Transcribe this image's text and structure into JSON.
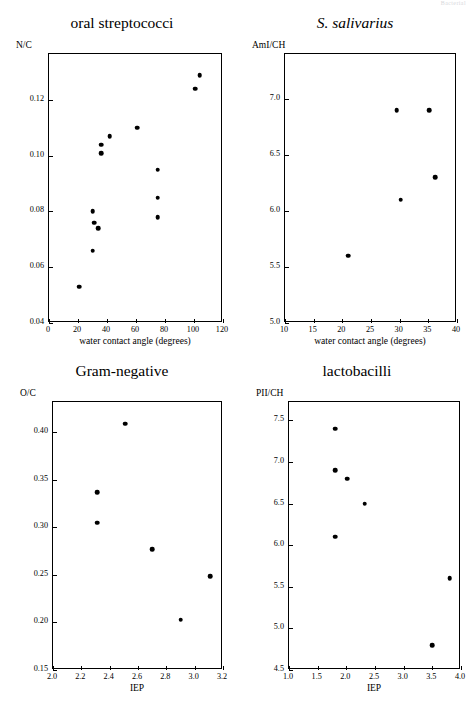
{
  "page": {
    "header_text": "Bacterial"
  },
  "chart_data": [
    {
      "id": "oral-streptococci",
      "type": "scatter",
      "title": "oral streptococci",
      "title_italic": false,
      "ylabel": "N/C",
      "xlabel": "water contact angle (degrees)",
      "xlim": [
        0,
        120
      ],
      "ylim": [
        0.04,
        0.1365
      ],
      "xticks": [
        0,
        20,
        40,
        60,
        80,
        100,
        120
      ],
      "xticklabels": [
        "0",
        "20",
        "40",
        "60",
        "80",
        "100",
        "120"
      ],
      "yticks": [
        0.04,
        0.06,
        0.08,
        0.1,
        0.12
      ],
      "yticklabels": [
        "0.04",
        "0.06",
        "0.08",
        "0.10",
        "0.12"
      ],
      "grid": false,
      "legend": "none",
      "points": [
        {
          "x": 21,
          "y": 0.053
        },
        {
          "x": 30,
          "y": 0.066
        },
        {
          "x": 30,
          "y": 0.08
        },
        {
          "x": 31,
          "y": 0.076
        },
        {
          "x": 34,
          "y": 0.074
        },
        {
          "x": 36,
          "y": 0.101
        },
        {
          "x": 36,
          "y": 0.104
        },
        {
          "x": 42,
          "y": 0.107
        },
        {
          "x": 61,
          "y": 0.11
        },
        {
          "x": 75,
          "y": 0.095
        },
        {
          "x": 75,
          "y": 0.085
        },
        {
          "x": 75,
          "y": 0.078
        },
        {
          "x": 101,
          "y": 0.124
        },
        {
          "x": 104,
          "y": 0.129
        }
      ]
    },
    {
      "id": "s-salivarius",
      "type": "scatter",
      "title": "S. salivarius",
      "title_italic": true,
      "ylabel": "AmI/CH",
      "xlabel": "water contact angle (degrees)",
      "xlim": [
        10,
        40
      ],
      "ylim": [
        5.0,
        7.4
      ],
      "xticks": [
        10,
        15,
        20,
        25,
        30,
        35,
        40
      ],
      "xticklabels": [
        "10",
        "15",
        "20",
        "25",
        "30",
        "35",
        "40"
      ],
      "yticks": [
        5.0,
        5.5,
        6.0,
        6.5,
        7.0
      ],
      "yticklabels": [
        "5.0",
        "5.5",
        "6.0",
        "6.5",
        "7.0"
      ],
      "grid": false,
      "legend": "none",
      "points": [
        {
          "x": 21.0,
          "y": 5.6
        },
        {
          "x": 29.5,
          "y": 6.9
        },
        {
          "x": 30.2,
          "y": 6.1
        },
        {
          "x": 35.2,
          "y": 6.9
        },
        {
          "x": 36.2,
          "y": 6.3
        }
      ]
    },
    {
      "id": "gram-negative",
      "type": "scatter",
      "title": "Gram-negative",
      "title_italic": false,
      "ylabel": "O/C",
      "xlabel": "IEP",
      "xlim": [
        2.0,
        3.2
      ],
      "ylim": [
        0.15,
        0.432
      ],
      "xticks": [
        2.0,
        2.2,
        2.4,
        2.6,
        2.8,
        3.0,
        3.2
      ],
      "xticklabels": [
        "2.0",
        "2.2",
        "2.4",
        "2.6",
        "2.8",
        "3.0",
        "3.2"
      ],
      "yticks": [
        0.15,
        0.2,
        0.25,
        0.3,
        0.35,
        0.4
      ],
      "yticklabels": [
        "0.15",
        "0.20",
        "0.25",
        "0.30",
        "0.35",
        "0.40"
      ],
      "grid": false,
      "legend": "none",
      "points": [
        {
          "x": 2.31,
          "y": 0.337
        },
        {
          "x": 2.31,
          "y": 0.305
        },
        {
          "x": 2.51,
          "y": 0.409
        },
        {
          "x": 2.7,
          "y": 0.277
        },
        {
          "x": 2.9,
          "y": 0.203
        },
        {
          "x": 3.11,
          "y": 0.249
        }
      ]
    },
    {
      "id": "lactobacilli",
      "type": "scatter",
      "title": "lactobacilli",
      "title_italic": false,
      "ylabel": "PII/CH",
      "xlabel": "IEP",
      "xlim": [
        1.0,
        4.0
      ],
      "ylim": [
        4.5,
        7.72
      ],
      "xticks": [
        1.0,
        1.5,
        2.0,
        2.5,
        3.0,
        3.5,
        4.0
      ],
      "xticklabels": [
        "1.0",
        "1.5",
        "2.0",
        "2.5",
        "3.0",
        "3.5",
        "4.0"
      ],
      "yticks": [
        4.5,
        5.0,
        5.5,
        6.0,
        6.5,
        7.0,
        7.5
      ],
      "yticklabels": [
        "4.5",
        "5.0",
        "5.5",
        "6.0",
        "6.5",
        "7.0",
        "7.5"
      ],
      "grid": false,
      "legend": "none",
      "points": [
        {
          "x": 1.81,
          "y": 7.4
        },
        {
          "x": 1.81,
          "y": 6.9
        },
        {
          "x": 1.81,
          "y": 6.1
        },
        {
          "x": 2.02,
          "y": 6.8
        },
        {
          "x": 2.32,
          "y": 6.5
        },
        {
          "x": 3.5,
          "y": 4.8
        },
        {
          "x": 3.8,
          "y": 5.6
        }
      ]
    }
  ],
  "layout": {
    "panels": [
      {
        "left": 8,
        "top": 14,
        "frame_x": 40,
        "frame_y": 39,
        "frame_w": 174,
        "frame_h": 269
      },
      {
        "left": 240,
        "top": 14,
        "frame_x": 44,
        "frame_y": 39,
        "frame_w": 172,
        "frame_h": 269
      },
      {
        "left": 8,
        "top": 362,
        "frame_x": 44,
        "frame_y": 39,
        "frame_w": 170,
        "frame_h": 268
      },
      {
        "left": 240,
        "top": 362,
        "frame_x": 48,
        "frame_y": 39,
        "frame_w": 172,
        "frame_h": 268
      }
    ]
  }
}
